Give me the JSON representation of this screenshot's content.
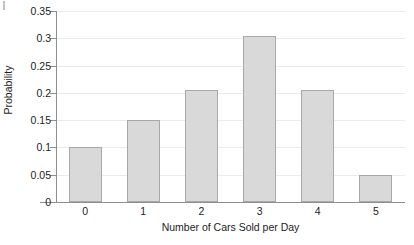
{
  "chart_data": {
    "type": "bar",
    "title": "",
    "xlabel": "Number of Cars Sold per Day",
    "ylabel": "Probability",
    "categories": [
      "0",
      "1",
      "2",
      "3",
      "4",
      "5"
    ],
    "values": [
      0.1,
      0.15,
      0.205,
      0.305,
      0.205,
      0.05
    ],
    "ylim": [
      0,
      0.35
    ],
    "ytick_labels": [
      "0",
      "0.05",
      "0.1",
      "0.15",
      "0.2",
      "0.25",
      "0.3",
      "0.35"
    ],
    "ytick_values": [
      0,
      0.05,
      0.1,
      0.15,
      0.2,
      0.25,
      0.3,
      0.35
    ],
    "grid": true,
    "grid_axis": "y",
    "legend": null,
    "bar_fill_color": "#d9d9d9",
    "bar_border_color": "#a8a8a8",
    "gridline_color": "#ebebeb",
    "axis_color": "#8e8e8e",
    "text_color": "#1d1d1d",
    "background_color": "#ffffff"
  }
}
